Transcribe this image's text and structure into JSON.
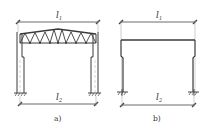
{
  "figure": {
    "colors": {
      "line": "#3a3a3a",
      "light": "#8a8a8a",
      "background": "#ffffff"
    },
    "panels": [
      {
        "id": "a",
        "caption": "a)",
        "type": "truss-roof portal frame with stepped columns",
        "top_dimension": {
          "symbol": "l",
          "subscript": "1"
        },
        "bottom_dimension": {
          "symbol": "l",
          "subscript": "2"
        }
      },
      {
        "id": "b",
        "caption": "b)",
        "type": "beam portal frame with stepped columns",
        "top_dimension": {
          "symbol": "l",
          "subscript": "1"
        },
        "bottom_dimension": {
          "symbol": "l",
          "subscript": "2"
        }
      }
    ]
  }
}
